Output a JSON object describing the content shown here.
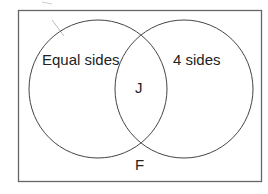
{
  "diagram": {
    "type": "venn",
    "universe_label": "F",
    "sets": [
      {
        "name": "left-set",
        "label": "Equal sides"
      },
      {
        "name": "right-set",
        "label": "4 sides"
      }
    ],
    "intersection_label": "J",
    "colors": {
      "stroke": "#444444",
      "frame": "#666666",
      "text": "#222222",
      "background": "#ffffff"
    }
  }
}
